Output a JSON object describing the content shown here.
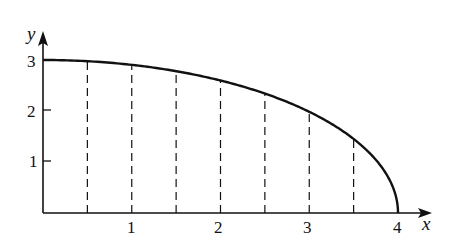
{
  "chart_data": {
    "type": "line",
    "title": "",
    "xlabel": "x",
    "ylabel": "y",
    "function": "y = (3/4) * sqrt(16 - x^2)",
    "xlim": [
      0,
      4
    ],
    "ylim": [
      0,
      3
    ],
    "x_ticks": [
      "1",
      "2",
      "3",
      "4"
    ],
    "y_ticks": [
      "1",
      "2",
      "3"
    ],
    "grid": false,
    "series": [
      {
        "name": "curve",
        "x": [
          0,
          0.5,
          1,
          1.5,
          2,
          2.5,
          3,
          3.5,
          4
        ],
        "y": [
          3.0,
          2.976,
          2.905,
          2.781,
          2.598,
          2.342,
          1.984,
          1.452,
          0
        ]
      }
    ],
    "dashed_verticals_at_x": [
      0.5,
      1,
      1.5,
      2,
      2.5,
      3,
      3.5
    ]
  },
  "labels": {
    "x_axis": "x",
    "y_axis": "y",
    "xt1": "1",
    "xt2": "2",
    "xt3": "3",
    "xt4": "4",
    "yt1": "1",
    "yt2": "2",
    "yt3": "3"
  },
  "colors": {
    "ink": "#111111",
    "background": "#ffffff"
  }
}
